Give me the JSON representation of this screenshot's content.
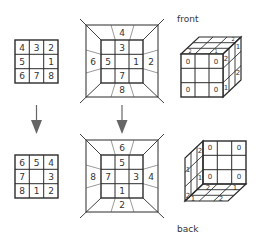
{
  "colors": {
    "line": "#2b2b2b",
    "thin_line": "#555555",
    "arrow": "#666666",
    "text": "#333333"
  },
  "left_top_grid": {
    "cells": [
      [
        "4",
        "3",
        "2"
      ],
      [
        "5",
        "",
        "1"
      ],
      [
        "6",
        "7",
        "8"
      ]
    ]
  },
  "left_bottom_grid": {
    "cells": [
      [
        "6",
        "5",
        "4"
      ],
      [
        "7",
        "",
        "3"
      ],
      [
        "8",
        "1",
        "2"
      ]
    ]
  },
  "middle_top_frame": {
    "inner_cells": [
      [
        "",
        "3",
        ""
      ],
      [
        "5",
        "",
        "1"
      ],
      [
        "",
        "7",
        ""
      ]
    ],
    "outer": {
      "top": "4",
      "left": "6",
      "right": "2",
      "bottom": "8"
    }
  },
  "middle_bottom_frame": {
    "inner_cells": [
      [
        "",
        "5",
        ""
      ],
      [
        "7",
        "",
        "3"
      ],
      [
        "",
        "1",
        ""
      ]
    ],
    "outer": {
      "top": "6",
      "left": "8",
      "right": "4",
      "bottom": "2"
    }
  },
  "arrows": [
    {
      "name": "left-down-arrow",
      "direction": "down"
    },
    {
      "name": "middle-down-arrow",
      "direction": "down"
    }
  ],
  "front_cube": {
    "label": "front",
    "face_corners": {
      "tl": "0",
      "tr": "0",
      "bl": "0",
      "br": "0"
    },
    "side_labels": {
      "top_near": "2",
      "top_far": "1",
      "mid_far": "2",
      "bottom_near": "1"
    },
    "top_labels": {
      "a": "2",
      "b": "1",
      "c": "2"
    }
  },
  "back_cube": {
    "label": "back",
    "face_corners": {
      "tl": "0",
      "tr": "0",
      "bl": "0",
      "br": "0"
    },
    "side_labels": {
      "top": "2",
      "mid": "1",
      "low": "1",
      "bottom": "2"
    },
    "floor_labels": {
      "a": "2",
      "b": "1",
      "c": "1",
      "d": "2"
    }
  }
}
